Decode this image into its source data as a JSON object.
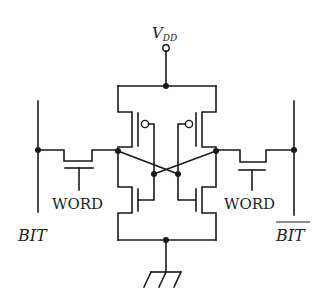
{
  "diagram": {
    "type": "circuit-schematic",
    "labels": {
      "supply": "V",
      "supply_sub": "DD",
      "bit_left": "BIT",
      "bit_right": "BIT",
      "word_left": "WORD",
      "word_right": "WORD"
    },
    "components": [
      {
        "id": "pmos-left",
        "type": "PMOS"
      },
      {
        "id": "pmos-right",
        "type": "PMOS"
      },
      {
        "id": "nmos-left",
        "type": "NMOS"
      },
      {
        "id": "nmos-right",
        "type": "NMOS"
      },
      {
        "id": "access-left",
        "type": "NMOS",
        "gate": "WORD"
      },
      {
        "id": "access-right",
        "type": "NMOS",
        "gate": "WORD"
      },
      {
        "id": "vdd-terminal",
        "type": "supply"
      },
      {
        "id": "ground",
        "type": "ground"
      }
    ],
    "colors": {
      "ink": "#1a1a1a",
      "background": "#ffffff"
    }
  }
}
